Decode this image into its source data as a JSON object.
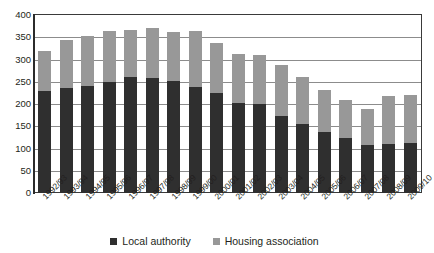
{
  "chart_data": {
    "type": "bar",
    "stacked": true,
    "title": "",
    "subtitle": "",
    "xlabel": "",
    "ylabel": "",
    "ylim": [
      0,
      400
    ],
    "ytick_step": 50,
    "yticks": [
      400,
      350,
      300,
      250,
      200,
      150,
      100,
      50,
      0
    ],
    "grid": true,
    "grid_axis": "y",
    "legend_position": "bottom",
    "categories": [
      "1992/93",
      "1993/94",
      "1994/95",
      "1995/96",
      "1996/97",
      "1997/98",
      "1998/99",
      "1999/00",
      "2000/01",
      "2001/02",
      "2002/03",
      "2003/04",
      "2004/05",
      "2005/06",
      "2006/07",
      "2007/08",
      "2008/09",
      "2009/10"
    ],
    "series": [
      {
        "name": "Local authority",
        "color": "#2f2f2f",
        "values": [
          230,
          235,
          240,
          250,
          261,
          259,
          251,
          238,
          224,
          202,
          199,
          172,
          155,
          136,
          124,
          107,
          110,
          112
        ]
      },
      {
        "name": "Housing association",
        "color": "#989898",
        "values": [
          89,
          109,
          113,
          114,
          106,
          111,
          111,
          125,
          114,
          110,
          112,
          116,
          105,
          96,
          85,
          81,
          108,
          108
        ]
      }
    ],
    "totals": [
      319,
      344,
      353,
      364,
      367,
      370,
      362,
      363,
      338,
      312,
      311,
      288,
      260,
      232,
      209,
      188,
      218,
      220
    ]
  },
  "legend": {
    "items": [
      {
        "label": "Local authority",
        "color": "#2f2f2f"
      },
      {
        "label": "Housing association",
        "color": "#989898"
      }
    ]
  }
}
